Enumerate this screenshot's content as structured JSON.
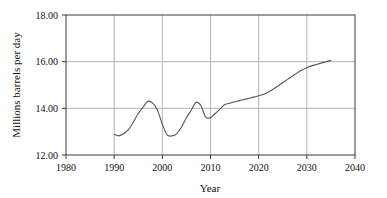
{
  "chart_data": {
    "type": "line",
    "title": "",
    "xlabel": "Year",
    "ylabel": "Millions barrels per day",
    "xlim": [
      1980,
      2040
    ],
    "ylim": [
      12.0,
      18.0
    ],
    "xticks": [
      1980,
      1990,
      2000,
      2010,
      2020,
      2030,
      2040
    ],
    "xtick_labels": [
      "1980",
      "1990",
      "2000",
      "2010",
      "2020",
      "2030",
      "2040"
    ],
    "yticks": [
      12.0,
      14.0,
      16.0,
      18.0
    ],
    "ytick_labels": [
      "12.00",
      "14.00",
      "16.00",
      "18.00"
    ],
    "grid": true,
    "grid_color": "#b4b4b4",
    "line_color": "#555555",
    "legend": null,
    "series": [
      {
        "name": "Millions barrels per day",
        "x": [
          1990,
          1991,
          1992,
          1993,
          1994,
          1995,
          1996,
          1997,
          1998,
          1999,
          2000,
          2001,
          2002,
          2003,
          2004,
          2005,
          2006,
          2007,
          2008,
          2009,
          2010,
          2011,
          2012,
          2013,
          2014,
          2015,
          2016,
          2017,
          2018,
          2019,
          2020,
          2021,
          2022,
          2023,
          2024,
          2025,
          2026,
          2027,
          2028,
          2029,
          2030,
          2031,
          2032,
          2033,
          2034,
          2035
        ],
        "values": [
          12.88,
          12.82,
          12.92,
          13.1,
          13.42,
          13.78,
          14.05,
          14.3,
          14.22,
          13.92,
          13.32,
          12.86,
          12.82,
          12.92,
          13.2,
          13.6,
          13.92,
          14.26,
          14.12,
          13.62,
          13.6,
          13.78,
          13.98,
          14.16,
          14.22,
          14.28,
          14.33,
          14.38,
          14.43,
          14.48,
          14.54,
          14.6,
          14.7,
          14.82,
          14.96,
          15.1,
          15.24,
          15.38,
          15.52,
          15.64,
          15.74,
          15.82,
          15.88,
          15.94,
          16.0,
          16.05
        ]
      }
    ]
  }
}
